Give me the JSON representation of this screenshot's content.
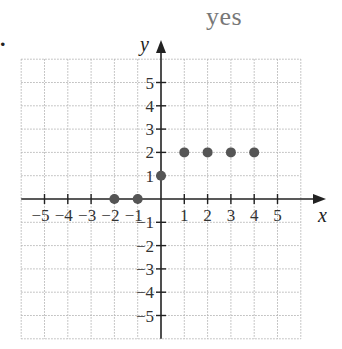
{
  "caption": "yes",
  "bullet": ".",
  "colors": {
    "axis": "#222222",
    "grid": "#b5b5b5",
    "point": "#555555",
    "caption": "#777777"
  },
  "chart_data": {
    "type": "scatter",
    "title": "yes",
    "xlabel": "x",
    "ylabel": "y",
    "xlim": [
      -6,
      6
    ],
    "ylim": [
      -6,
      6
    ],
    "grid": true,
    "grid_style": "dotted",
    "x_ticks": [
      -5,
      -4,
      -3,
      -2,
      -1,
      1,
      2,
      3,
      4,
      5
    ],
    "y_ticks": [
      -5,
      -4,
      -3,
      -2,
      -1,
      1,
      2,
      3,
      4,
      5
    ],
    "x_tick_labels": [
      "−5",
      "−4",
      "−3",
      "−2",
      "−1",
      "1",
      "2",
      "3",
      "4",
      "5"
    ],
    "y_tick_labels": [
      "−5",
      "−4",
      "−3",
      "−2",
      "−1",
      "1",
      "2",
      "3",
      "4",
      "5"
    ],
    "series": [
      {
        "name": "points",
        "points": [
          {
            "x": -2,
            "y": 0
          },
          {
            "x": -1,
            "y": 0
          },
          {
            "x": 0,
            "y": 1
          },
          {
            "x": 1,
            "y": 2
          },
          {
            "x": 2,
            "y": 2
          },
          {
            "x": 3,
            "y": 2
          },
          {
            "x": 4,
            "y": 2
          }
        ]
      }
    ]
  }
}
